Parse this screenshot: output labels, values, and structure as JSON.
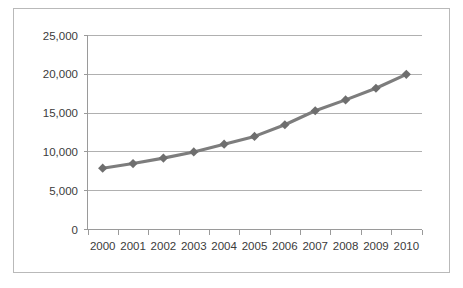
{
  "chart_data": {
    "type": "line",
    "title": "",
    "xlabel": "",
    "ylabel": "",
    "categories": [
      "2000",
      "2001",
      "2002",
      "2003",
      "2004",
      "2005",
      "2006",
      "2007",
      "2008",
      "2009",
      "2010"
    ],
    "values": [
      7900,
      8500,
      9200,
      10000,
      11000,
      12000,
      13500,
      15300,
      16700,
      18200,
      20000
    ],
    "series": [
      {
        "name": "Series 1",
        "values": [
          7900,
          8500,
          9200,
          10000,
          11000,
          12000,
          13500,
          15300,
          16700,
          18200,
          20000
        ]
      }
    ],
    "ylim": [
      0,
      25000
    ],
    "ytick_values": [
      0,
      5000,
      10000,
      15000,
      20000,
      25000
    ],
    "ytick_labels": [
      "0",
      "5,000",
      "10,000",
      "15,000",
      "20,000",
      "25,000"
    ],
    "xtick_labels": [
      "2000",
      "2001",
      "2002",
      "2003",
      "2004",
      "2005",
      "2006",
      "2007",
      "2008",
      "2009",
      "2010"
    ],
    "grid": true,
    "grid_axis": "y",
    "legend": false,
    "legend_position": "none",
    "marker": "diamond",
    "line_color": "#7d7d7d",
    "marker_color": "#6e6e6e",
    "grid_color": "#b0b0b0",
    "axis_color": "#9a9a9a",
    "text_color": "#3b3b3b",
    "background_color": "#ffffff",
    "border_color": "#b9b9b9"
  }
}
